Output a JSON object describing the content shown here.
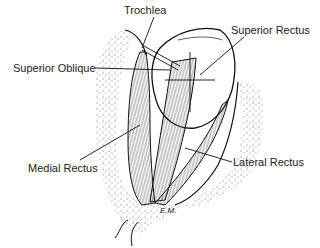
{
  "diagram": {
    "labels": {
      "trochlea": "Trochlea",
      "superior_rectus": "Superior Rectus",
      "superior_oblique": "Superior Oblique",
      "medial_rectus": "Medial Rectus",
      "lateral_rectus": "Lateral Rectus"
    },
    "signature": "E.M."
  }
}
